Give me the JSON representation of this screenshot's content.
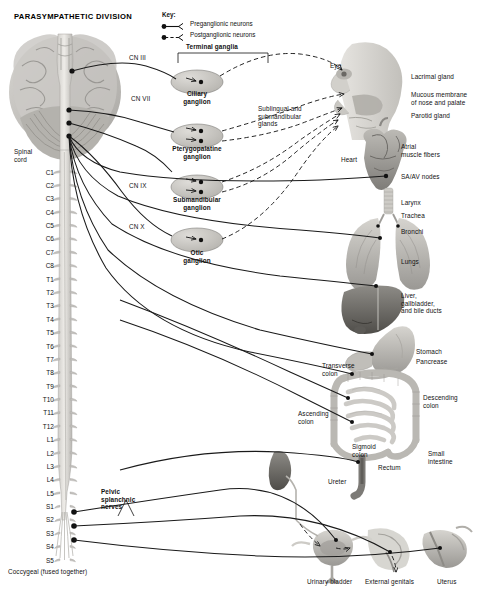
{
  "title": "PARASYMPATHETIC DIVISION",
  "key": {
    "heading": "Key:",
    "items": [
      {
        "label": "Preganglionic neurons",
        "style": "solid",
        "icon": "preganglionic-line-icon"
      },
      {
        "label": "Postganglionic neurons",
        "style": "dashed",
        "icon": "postganglionic-line-icon"
      }
    ]
  },
  "ganglia": {
    "group_label": "Terminal ganglia",
    "items": [
      {
        "name": "Ciliary\nganglion",
        "cx": 197,
        "cy": 82
      },
      {
        "name": "Pterygopalatine\nganglion",
        "cx": 197,
        "cy": 136
      },
      {
        "name": "Submandibular\nganglion",
        "cx": 197,
        "cy": 187
      },
      {
        "name": "Otic\nganglion",
        "cx": 197,
        "cy": 240
      }
    ]
  },
  "cranial_nerves": [
    {
      "label": "CN III",
      "x": 129,
      "y": 57
    },
    {
      "label": "CN VII",
      "x": 131,
      "y": 98
    },
    {
      "label": "CN IX",
      "x": 129,
      "y": 185
    },
    {
      "label": "CN X",
      "x": 129,
      "y": 226
    }
  ],
  "spinal_cord": {
    "label": "Spinal\ncord",
    "coccygeal_note": "Coccygeal (fused together)",
    "segments": [
      "C1",
      "C2",
      "C3",
      "C4",
      "C5",
      "C6",
      "C7",
      "C8",
      "T1",
      "T2",
      "T3",
      "T4",
      "T5",
      "T6",
      "T7",
      "T8",
      "T9",
      "T10",
      "T11",
      "T12",
      "L1",
      "L2",
      "L3",
      "L4",
      "L5",
      "S1",
      "S2",
      "S3",
      "S4",
      "S5"
    ]
  },
  "pelvic_nerves": {
    "label": "Pelvic\nsplanchnic\nnerves"
  },
  "organ_labels": [
    {
      "name": "eye-label",
      "text": "Eye",
      "x": 330,
      "y": 62,
      "align": "left"
    },
    {
      "name": "lacrimal-gland-label",
      "text": "Lacrimal gland",
      "x": 411,
      "y": 73,
      "align": "left"
    },
    {
      "name": "mucous-membrane-label",
      "text": "Mucous membrane\nof nose and palate",
      "x": 411,
      "y": 91,
      "align": "left"
    },
    {
      "name": "parotid-gland-label",
      "text": "Parotid gland",
      "x": 411,
      "y": 112,
      "align": "left"
    },
    {
      "name": "sublingual-submandibular-label",
      "text": "Sublingual and\nsubmandibular\nglands",
      "x": 258,
      "y": 105,
      "align": "left"
    },
    {
      "name": "heart-label",
      "text": "Heart",
      "x": 341,
      "y": 156,
      "align": "left"
    },
    {
      "name": "atrial-muscle-label",
      "text": "Atrial\nmuscle fibers",
      "x": 401,
      "y": 143,
      "align": "left"
    },
    {
      "name": "sa-av-nodes-label",
      "text": "SA/AV nodes",
      "x": 401,
      "y": 173,
      "align": "left"
    },
    {
      "name": "larynx-label",
      "text": "Larynx",
      "x": 401,
      "y": 199,
      "align": "left"
    },
    {
      "name": "trachea-label",
      "text": "Trachea",
      "x": 401,
      "y": 212,
      "align": "left"
    },
    {
      "name": "bronchi-label",
      "text": "Bronchi",
      "x": 401,
      "y": 228,
      "align": "left"
    },
    {
      "name": "lungs-label",
      "text": "Lungs",
      "x": 401,
      "y": 258,
      "align": "left"
    },
    {
      "name": "liver-label",
      "text": "Liver,\ngallbladder,\nand bile ducts",
      "x": 401,
      "y": 292,
      "align": "left"
    },
    {
      "name": "stomach-label",
      "text": "Stomach",
      "x": 416,
      "y": 348,
      "align": "left"
    },
    {
      "name": "pancreas-label",
      "text": "Pancrease",
      "x": 416,
      "y": 358,
      "align": "left"
    },
    {
      "name": "transverse-colon-label",
      "text": "Transverse\ncolon",
      "x": 322,
      "y": 362,
      "align": "left"
    },
    {
      "name": "descending-colon-label",
      "text": "Descending\ncolon",
      "x": 423,
      "y": 394,
      "align": "left"
    },
    {
      "name": "ascending-colon-label",
      "text": "Ascending\ncolon",
      "x": 298,
      "y": 410,
      "align": "left"
    },
    {
      "name": "small-intestine-label",
      "text": "Small\nintestine",
      "x": 428,
      "y": 450,
      "align": "left"
    },
    {
      "name": "sigmoid-colon-label",
      "text": "Sigmoid\ncolon",
      "x": 352,
      "y": 443,
      "align": "left"
    },
    {
      "name": "rectum-label",
      "text": "Rectum",
      "x": 378,
      "y": 464,
      "align": "left"
    },
    {
      "name": "ureter-label",
      "text": "Ureter",
      "x": 328,
      "y": 478,
      "align": "left"
    },
    {
      "name": "urinary-bladder-label",
      "text": "Urinary bladder",
      "x": 307,
      "y": 578,
      "align": "left"
    },
    {
      "name": "external-genitals-label",
      "text": "External genitals",
      "x": 365,
      "y": 578,
      "align": "left"
    },
    {
      "name": "uterus-label",
      "text": "Uterus",
      "x": 437,
      "y": 578,
      "align": "left"
    }
  ]
}
